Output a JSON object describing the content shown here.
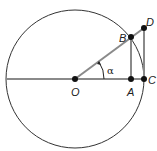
{
  "diagram": {
    "circle": {
      "cx": 75,
      "cy": 79,
      "r": 69,
      "stroke": "#333333"
    },
    "line_color": "#8a8a8a",
    "point_color": "#111111",
    "points": {
      "O": {
        "label": "O",
        "x": 75,
        "y": 79
      },
      "A": {
        "label": "A",
        "x": 131,
        "y": 79
      },
      "B": {
        "label": "B",
        "x": 131,
        "y": 37
      },
      "C": {
        "label": "C",
        "x": 144,
        "y": 79
      },
      "D": {
        "label": "D",
        "x": 144,
        "y": 28
      }
    },
    "angle": {
      "label": "α",
      "vertex": "O",
      "from": "OA",
      "to": "OB"
    },
    "segments": [
      "diameter-horizontal",
      "OD",
      "AB",
      "CD"
    ]
  }
}
